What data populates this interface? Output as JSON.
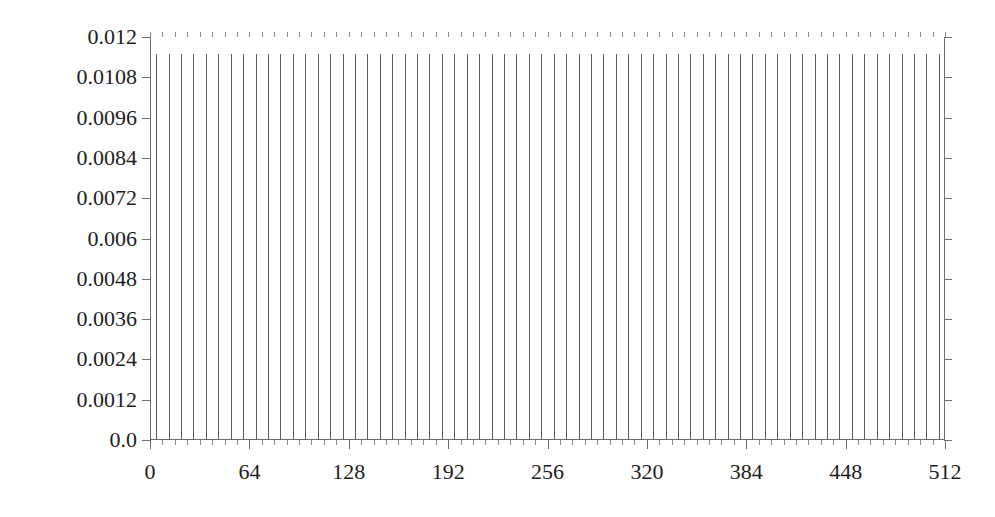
{
  "chart_data": {
    "type": "bar",
    "title": "",
    "subtitle": "",
    "xlabel": "",
    "ylabel": "",
    "xlim": [
      0,
      512
    ],
    "ylim": [
      0.0,
      0.012
    ],
    "grid": false,
    "legend": null,
    "annotations": [],
    "ytick_labels": [
      "0.012",
      "0.0108",
      "0.0096",
      "0.0084",
      "0.0072",
      "0.006",
      "0.0048",
      "0.0036",
      "0.0024",
      "0.0012",
      "0.0"
    ],
    "ytick_values": [
      0.012,
      0.0108,
      0.0096,
      0.0084,
      0.0072,
      0.006,
      0.0048,
      0.0036,
      0.0024,
      0.0012,
      0.0
    ],
    "xtick_labels": [
      "0",
      "64",
      "128",
      "192",
      "256",
      "320",
      "384",
      "448",
      "512"
    ],
    "xtick_values": [
      0,
      64,
      128,
      192,
      256,
      320,
      384,
      448,
      512
    ],
    "xtick_minor_step": 8,
    "bar_width": 1,
    "series_name": "density",
    "x": [
      4,
      12,
      20,
      28,
      36,
      44,
      52,
      60,
      68,
      76,
      84,
      92,
      100,
      108,
      116,
      124,
      132,
      140,
      148,
      156,
      164,
      172,
      180,
      188,
      196,
      204,
      212,
      220,
      228,
      236,
      244,
      252,
      260,
      268,
      276,
      284,
      292,
      300,
      308,
      316,
      324,
      332,
      340,
      348,
      356,
      364,
      372,
      380,
      388,
      396,
      404,
      412,
      420,
      428,
      436,
      444,
      452,
      460,
      468,
      476,
      484,
      492,
      500,
      508
    ],
    "values": [
      0.0115,
      0.0115,
      0.0115,
      0.0115,
      0.0115,
      0.0115,
      0.0115,
      0.0115,
      0.0115,
      0.0115,
      0.0115,
      0.0115,
      0.0115,
      0.0115,
      0.0115,
      0.0115,
      0.0115,
      0.0115,
      0.0115,
      0.0115,
      0.0115,
      0.0115,
      0.0115,
      0.0115,
      0.0115,
      0.0115,
      0.0115,
      0.0115,
      0.0115,
      0.0115,
      0.0115,
      0.0115,
      0.0115,
      0.0115,
      0.0115,
      0.0115,
      0.0115,
      0.0115,
      0.0115,
      0.0115,
      0.0115,
      0.0115,
      0.0115,
      0.0115,
      0.0115,
      0.0115,
      0.0115,
      0.0115,
      0.0115,
      0.0115,
      0.0115,
      0.0115,
      0.0115,
      0.0115,
      0.0115,
      0.0115,
      0.0115,
      0.0115,
      0.0115,
      0.0115,
      0.0115,
      0.0115,
      0.0115,
      0.0115
    ],
    "categories": [
      "4",
      "12",
      "20",
      "28",
      "36",
      "44",
      "52",
      "60",
      "68",
      "76",
      "84",
      "92",
      "100",
      "108",
      "116",
      "124",
      "132",
      "140",
      "148",
      "156",
      "164",
      "172",
      "180",
      "188",
      "196",
      "204",
      "212",
      "220",
      "228",
      "236",
      "244",
      "252",
      "260",
      "268",
      "276",
      "284",
      "292",
      "300",
      "308",
      "316",
      "324",
      "332",
      "340",
      "348",
      "356",
      "364",
      "372",
      "380",
      "388",
      "396",
      "404",
      "412",
      "420",
      "428",
      "436",
      "444",
      "452",
      "460",
      "468",
      "476",
      "484",
      "492",
      "500",
      "508"
    ],
    "colors": {
      "bar": "#5f5f5f",
      "axis": "#6e6e6e",
      "tick_minor": "#8a8a8a",
      "text": "#1d1d1d",
      "background": "#ffffff"
    }
  }
}
